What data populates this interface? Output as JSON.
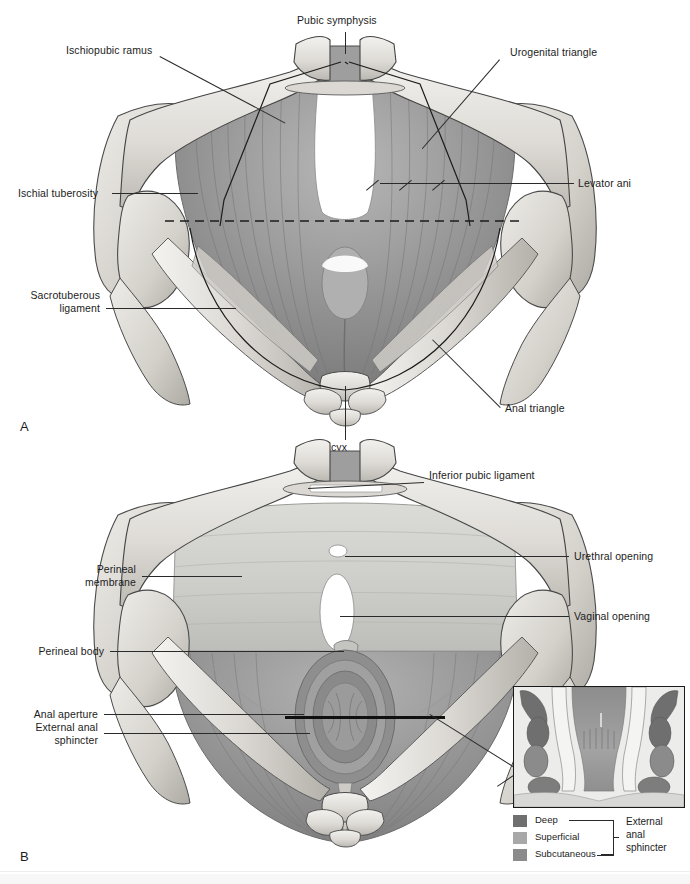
{
  "figure": {
    "type": "anatomical-illustration",
    "panels": [
      {
        "letter": "A",
        "caption": "Pelvic diaphragm (levator ani) viewed from below, with perineum divided into urogenital and anal triangles",
        "labels": [
          {
            "id": "pubic-symphysis",
            "text": "Pubic symphysis",
            "side": "top",
            "x": 297,
            "y": 19,
            "align": "left"
          },
          {
            "id": "ischiopubic-ramus",
            "text": "Ischiopubic ramus",
            "side": "left",
            "x": 66,
            "y": 49,
            "align": "left"
          },
          {
            "id": "urogenital-triangle",
            "text": "Urogenital triangle",
            "side": "right",
            "x": 510,
            "y": 51,
            "align": "left"
          },
          {
            "id": "ischial-tuberosity",
            "text": "Ischial tuberosity",
            "side": "left",
            "x": 18,
            "y": 188,
            "align": "left"
          },
          {
            "id": "levator-ani",
            "text": "Levator ani",
            "side": "right",
            "x": 577,
            "y": 178,
            "align": "left"
          },
          {
            "id": "sacrotuberous-ligament",
            "text": "Sacrotuberous\nligament",
            "side": "left",
            "x": 26,
            "y": 288,
            "align": "left"
          },
          {
            "id": "anal-triangle",
            "text": "Anal triangle",
            "side": "right",
            "x": 505,
            "y": 403,
            "align": "left"
          },
          {
            "id": "coccyx",
            "text": "Coccyx",
            "side": "bottom",
            "x": 312,
            "y": 443,
            "align": "left"
          }
        ]
      },
      {
        "letter": "B",
        "caption": "Perineal membrane, perineal body and external anal sphincter with urethral and vaginal openings",
        "labels": [
          {
            "id": "inferior-pubic-ligament",
            "text": "Inferior pubic ligament",
            "side": "top",
            "x": 429,
            "y": 474,
            "align": "left"
          },
          {
            "id": "urethral-opening",
            "text": "Urethral opening",
            "side": "right",
            "x": 573,
            "y": 551,
            "align": "left"
          },
          {
            "id": "perineal-membrane",
            "text": "Perineal\nmembrane",
            "side": "left",
            "x": 86,
            "y": 570,
            "align": "left"
          },
          {
            "id": "vaginal-opening",
            "text": "Vaginal opening",
            "side": "right",
            "x": 573,
            "y": 611,
            "align": "left"
          },
          {
            "id": "perineal-body",
            "text": "Perineal body",
            "side": "left",
            "x": 33,
            "y": 646,
            "align": "left"
          },
          {
            "id": "anal-aperture",
            "text": "Anal aperture",
            "side": "left",
            "x": 32,
            "y": 709,
            "align": "left"
          },
          {
            "id": "external-anal-sphincter",
            "text": "External anal\nsphincter",
            "side": "left",
            "x": 19,
            "y": 724,
            "align": "left"
          }
        ]
      }
    ],
    "panel_letters": {
      "a": "A",
      "b": "B"
    },
    "inset": {
      "title": "Coronal section through anal canal",
      "legend_items": [
        {
          "label": "Deep",
          "color": "#6f6f6f"
        },
        {
          "label": "Superficial",
          "color": "#a8a8a8"
        },
        {
          "label": "Subcutaneous",
          "color": "#8b8b8b"
        }
      ],
      "bracket_label": "External\nanal\nsphincter"
    },
    "colors": {
      "bone": "#e3e1dd",
      "bone_shadow": "#b9b6b1",
      "muscle_dark": "#7e7e7e",
      "muscle_mid": "#9a9a9a",
      "muscle_light": "#b5b5b5",
      "membrane": "#c9c9c6",
      "opening": "#ffffff",
      "outline": "#3a3a3a",
      "label_text": "#1c1c1c",
      "leader": "#2a2a2a",
      "inset_bg": "#e9e9e9",
      "page_bg": "#ffffff"
    }
  }
}
